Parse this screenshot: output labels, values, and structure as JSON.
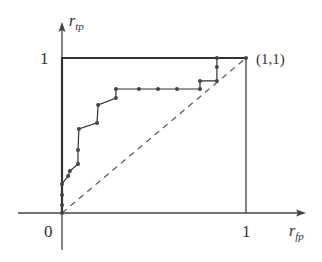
{
  "chart_data": {
    "type": "line",
    "title": "",
    "xlabel": "r_fp",
    "ylabel": "r_tp",
    "xlim": [
      0,
      1
    ],
    "ylim": [
      0,
      1
    ],
    "grid": false,
    "legend": null,
    "tick_labels": {
      "origin": "0",
      "x_one": "1",
      "y_one": "1"
    },
    "annotations": [
      {
        "text": "(1,1)",
        "x": 1,
        "y": 1
      }
    ],
    "series": [
      {
        "name": "ROC curve (empirical)",
        "style": "solid-with-markers",
        "x": [
          0,
          0,
          0,
          0,
          0.033,
          0.043,
          0.087,
          0.087,
          0.092,
          0.19,
          0.196,
          0.293,
          0.293,
          0.418,
          0.522,
          0.625,
          0.75,
          0.75,
          0.842,
          0.842,
          0.842,
          1.0
        ],
        "y": [
          0,
          0.052,
          0.116,
          0.187,
          0.239,
          0.271,
          0.316,
          0.406,
          0.542,
          0.581,
          0.697,
          0.742,
          0.8,
          0.8,
          0.8,
          0.8,
          0.8,
          0.852,
          0.852,
          0.942,
          1.0,
          1.0
        ]
      },
      {
        "name": "Ideal classifier",
        "style": "thick-solid",
        "x": [
          0,
          0,
          1,
          1
        ],
        "y": [
          0,
          1,
          1,
          0
        ]
      },
      {
        "name": "Random guess (diagonal)",
        "style": "dashed",
        "x": [
          0,
          1
        ],
        "y": [
          0,
          1
        ]
      }
    ]
  },
  "labels": {
    "y_axis_main": "r",
    "y_axis_sub": "tp",
    "x_axis_main": "r",
    "x_axis_sub": "fp",
    "origin": "0",
    "x_one": "1",
    "y_one": "1",
    "corner": "(1,1)"
  },
  "colors": {
    "line": "#333333",
    "dashed": "#555555",
    "marker": "#444444"
  }
}
